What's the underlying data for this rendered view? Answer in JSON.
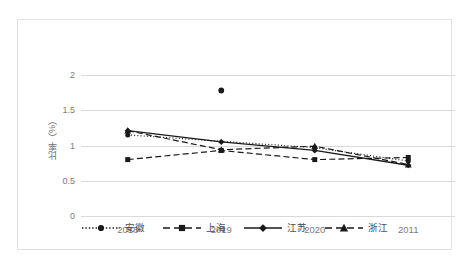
{
  "chart_data": {
    "type": "line",
    "title": "",
    "xlabel": "",
    "ylabel": "比率（%）",
    "categories": [
      "2018",
      "2019",
      "2020",
      "2011"
    ],
    "ylim": [
      0,
      2
    ],
    "yticks": [
      "0",
      "0.5",
      "1",
      "1.5",
      "2"
    ],
    "ytick_values": [
      0,
      0.5,
      1,
      1.5,
      2
    ],
    "grid": "horizontal",
    "legend_position": "bottom",
    "series": [
      {
        "name": "安徽",
        "marker": "circle",
        "line_style": "dotted",
        "values": [
          1.15,
          1.78,
          0.97,
          0.78
        ],
        "note": "2019 point plotted detached at 1.78"
      },
      {
        "name": "上海",
        "marker": "square",
        "line_style": "dashed",
        "values": [
          0.8,
          0.93,
          0.8,
          0.83
        ]
      },
      {
        "name": "江苏",
        "marker": "diamond",
        "line_style": "solid",
        "values": [
          1.21,
          1.05,
          0.93,
          0.72
        ]
      },
      {
        "name": "浙江",
        "marker": "triangle",
        "line_style": "dashed",
        "values": [
          1.21,
          0.94,
          0.99,
          0.73
        ]
      }
    ]
  },
  "caption": "",
  "colors": {
    "line": "#1a1a1a",
    "grid": "#d9d9d9",
    "frame": "#e2e2e2",
    "tick_text": "#7b7b7b"
  }
}
